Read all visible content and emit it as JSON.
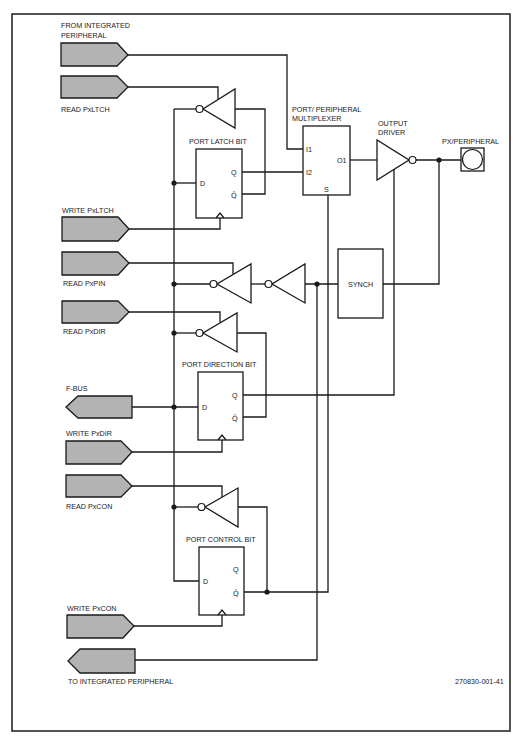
{
  "figure": {
    "id_label": "270830-001-41"
  },
  "signals": {
    "from_integrated_peripheral": {
      "line1": "FROM INTEGRATED",
      "line2": "PERIPHERAL"
    },
    "read_pxltch": "READ PxLTCH",
    "write_pxltch": "WRITE PxLTCH",
    "read_pxpin": "READ PxPIN",
    "read_pxdir": "READ PxDIR",
    "f_bus": "F-BUS",
    "write_pxdir": "WRITE PxDIR",
    "read_pxcon": "READ PxCON",
    "write_pxcon": "WRITE PxCON",
    "to_integrated_peripheral": "TO INTEGRATED PERIPHERAL"
  },
  "blocks": {
    "port_latch_bit": {
      "title": "PORT LATCH BIT",
      "d": "D",
      "q": "Q",
      "qbar": "Q̄"
    },
    "port_direction_bit": {
      "title": "PORT DIRECTION BIT",
      "d": "D",
      "q": "Q",
      "qbar": "Q̄"
    },
    "port_control_bit": {
      "title": "PORT CONTROL BIT",
      "d": "D",
      "q": "Q",
      "qbar": "Q̄"
    },
    "multiplexer": {
      "title_line1": "PORT/ PERIPHERAL",
      "title_line2": "MULTIPLEXER",
      "i1": "I1",
      "i2": "I2",
      "o1": "O1",
      "s": "S"
    },
    "output_driver": {
      "title_line1": "OUTPUT",
      "title_line2": "DRIVER"
    },
    "synch": {
      "label": "SYNCH"
    },
    "pad": {
      "label": "PX/PERIPHERAL"
    }
  },
  "colors": {
    "line": "#1a1a1a",
    "connector_fill": "#b3b3b3",
    "background": "#ffffff",
    "text": "#222222"
  }
}
